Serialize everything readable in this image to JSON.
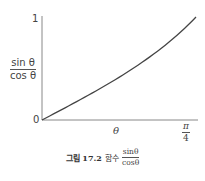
{
  "chart_data": {
    "type": "line",
    "xlabel": "θ",
    "ylabel": "sinθ / cosθ",
    "x_ticks": [
      "0",
      "π/4"
    ],
    "y_ticks": [
      "0",
      "1"
    ],
    "xlim": [
      0,
      0.7854
    ],
    "ylim": [
      0,
      1
    ],
    "grid": false,
    "series": [
      {
        "name": "tan θ",
        "x": [
          0,
          0.1,
          0.2,
          0.3,
          0.4,
          0.5,
          0.6,
          0.7,
          0.7854
        ],
        "y": [
          0,
          0.1003,
          0.2027,
          0.3093,
          0.4228,
          0.5463,
          0.6841,
          0.8423,
          1.0
        ]
      }
    ]
  },
  "axes": {
    "y_top_label": "1",
    "origin_label": "0",
    "ylabel_num": "sin θ",
    "ylabel_den": "cos θ",
    "xlabel": "θ",
    "x_end_num": "π",
    "x_end_den": "4"
  },
  "caption": {
    "figure": "그림 17.2",
    "text": "함수",
    "num": "sinθ",
    "den": "cosθ"
  }
}
